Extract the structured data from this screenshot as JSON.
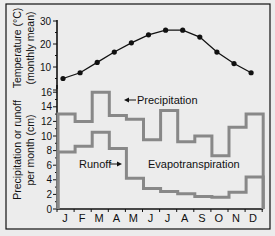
{
  "chart_data": [
    {
      "type": "line",
      "title": "",
      "xlabel": "",
      "ylabel": "Temperature (°C) (monthly mean)",
      "ylabel_lines": [
        "Temperature (°C)",
        "(monthly mean)"
      ],
      "categories": [
        "J",
        "F",
        "M",
        "A",
        "M",
        "J",
        "J",
        "A",
        "S",
        "O",
        "N",
        "D"
      ],
      "series": [
        {
          "name": "Temperature",
          "values": [
            5,
            7.5,
            12,
            16.5,
            20.5,
            24,
            26,
            26,
            23,
            16.5,
            11.5,
            7.5
          ]
        }
      ],
      "yticks": [
        10,
        20,
        30
      ],
      "ylim": [
        0,
        30
      ],
      "grid": false,
      "markers": true
    },
    {
      "type": "line",
      "step": true,
      "title": "",
      "xlabel": "",
      "ylabel": "Precipitation or runoff per month (cm)",
      "ylabel_lines": [
        "Precipitation or runoff",
        "per month (cm)"
      ],
      "categories": [
        "J",
        "F",
        "M",
        "A",
        "M",
        "J",
        "J",
        "A",
        "S",
        "O",
        "N",
        "D"
      ],
      "series": [
        {
          "name": "Precipitation",
          "values": [
            13,
            12,
            16,
            12.8,
            12.3,
            9.5,
            13.5,
            9.2,
            10,
            7.3,
            11.2,
            13
          ]
        },
        {
          "name": "Runoff",
          "values": [
            7.8,
            8.6,
            10.5,
            8.3,
            4.2,
            2.8,
            2.4,
            2.1,
            1.7,
            1.6,
            2.3,
            4.4
          ]
        }
      ],
      "annotations": [
        "Precipitation",
        "Runoff",
        "Evapotranspiration"
      ],
      "yticks": [
        0,
        2,
        4,
        6,
        8,
        10,
        12,
        14,
        16
      ],
      "ylim": [
        0,
        17
      ],
      "grid": false,
      "legend": "inline annotations with arrows"
    }
  ],
  "labels": {
    "temp_axis": [
      "Temperature (°C)",
      "(monthly mean)"
    ],
    "precip_axis": [
      "Precipitation or runoff",
      "per month (cm)"
    ],
    "precipitation": "Precipitation",
    "runoff": "Runoff",
    "evapotranspiration": "Evapotranspiration"
  },
  "colors": {
    "background": "#ececec",
    "step_line": "#888888",
    "temp_line": "#111111",
    "axis": "#111111"
  }
}
